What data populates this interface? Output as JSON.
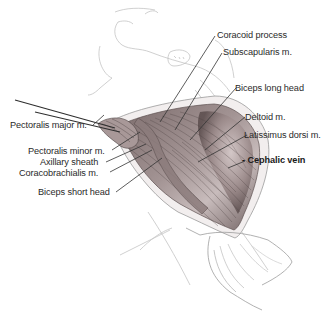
{
  "figure": {
    "title_fragment": "",
    "labels": {
      "coracoid_process": "Coracoid process",
      "subscapularis": "Subscapularis m.",
      "biceps_long_head": "Biceps long head",
      "deltoid": "Deltoid m.",
      "latissimus_dorsi": "Latissimus dorsi m.",
      "cephalic_vein": "- Cephalic vein",
      "pectoralis_major": "Pectoralis major m.",
      "pectoralis_minor": "Pectoralis minor m.",
      "axillary_sheath": "Axillary sheath",
      "coracobrachialis": "Coracobrachialis m.",
      "biceps_short_head": "Biceps short head"
    },
    "colors": {
      "line": "#3a3a3a",
      "sketch": "#b5b5b5",
      "muscle_dark": "#6e5f5f",
      "muscle_mid": "#9a8a8a",
      "muscle_light": "#c9bcbc",
      "wound_edge": "#e8e2e2"
    }
  }
}
